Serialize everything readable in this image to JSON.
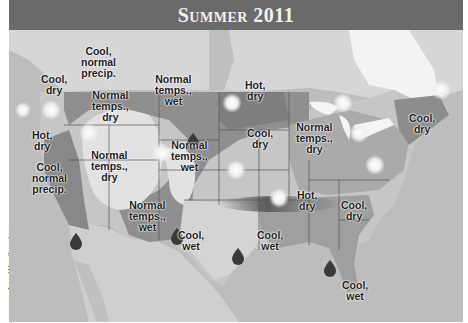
{
  "title": "Summer 2011",
  "credit": "—maps, AccuWeather, Inc.",
  "colors": {
    "title_bar": "#6a6a6a",
    "land_base": "#c9c9c9",
    "ocean": "#bdbdbd",
    "dark_region": "#8a8a8a",
    "medium_region": "#a3a3a3",
    "light_region": "#dcdcdc",
    "canada": "#d6d6d6"
  },
  "regions": [
    {
      "id": "pnw-coast",
      "label": "Cool,\ndry"
    },
    {
      "id": "n-rockies",
      "label": "Cool,\nnormal\nprecip."
    },
    {
      "id": "intermountain",
      "label": "Normal\ntemps.,\ndry"
    },
    {
      "id": "n-plains",
      "label": "Normal\ntemps.,\nwet"
    },
    {
      "id": "upper-midwest",
      "label": "Hot,\ndry"
    },
    {
      "id": "ca-interior",
      "label": "Hot,\ndry"
    },
    {
      "id": "ca-coast",
      "label": "Cool,\nnormal\nprecip."
    },
    {
      "id": "great-basin",
      "label": "Normal\ntemps.,\ndry"
    },
    {
      "id": "c-plains",
      "label": "Normal\ntemps.,\nwet"
    },
    {
      "id": "iowa",
      "label": "Cool,\ndry"
    },
    {
      "id": "great-lakes",
      "label": "Normal\ntemps.,\ndry"
    },
    {
      "id": "new-england",
      "label": "Cool,\ndry"
    },
    {
      "id": "southwest",
      "label": "Normal\ntemps.,\nwet"
    },
    {
      "id": "texas",
      "label": "Cool,\nwet"
    },
    {
      "id": "tennessee",
      "label": "Hot,\ndry"
    },
    {
      "id": "carolinas",
      "label": "Cool,\ndry"
    },
    {
      "id": "louisiana",
      "label": "Cool,\nwet"
    },
    {
      "id": "florida",
      "label": "Cool,\nwet"
    }
  ],
  "legend_icons": {
    "sun": "sun-icon (hot/dry)",
    "drop": "raindrop-icon (wet)"
  }
}
